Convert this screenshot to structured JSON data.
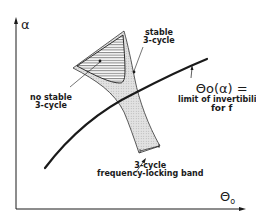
{
  "diagram": {
    "axes": {
      "y_label": "α",
      "x_label": "Θo",
      "x_label_main": "Θ",
      "x_label_sub": "o"
    },
    "regions": [
      {
        "name": "no-stable-3-cycle",
        "label_line1": "no stable",
        "label_line2": "3-cycle",
        "fill": "hatched"
      },
      {
        "name": "stable-3-cycle",
        "label_line1": "stable",
        "label_line2": "3-cycle",
        "fill": "dotted"
      }
    ],
    "band_label": {
      "line1": "3-cycle",
      "line2": "frequency-locking band"
    },
    "curve_label": {
      "title": "Θo(α) =",
      "line2": "limit of invertibility",
      "line3": "for f"
    },
    "colors": {
      "ink": "#1a1a1a",
      "dotted_fill": "#d9d9d9",
      "background": "#ffffff"
    }
  }
}
